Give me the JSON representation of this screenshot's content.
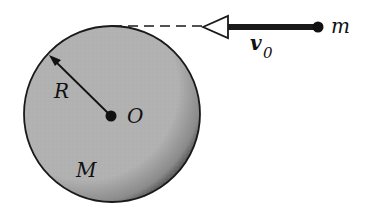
{
  "diagram": {
    "title": "",
    "disk": {
      "mass_label": "M",
      "radius_label": "R",
      "center_label": "O",
      "fill": "#b4b4b4",
      "edge": "#1a1a1a"
    },
    "projectile": {
      "mass_label": "m",
      "velocity_label": "v",
      "velocity_subscript": "0"
    },
    "guide_line": "dashed tangent line at top of disk"
  }
}
